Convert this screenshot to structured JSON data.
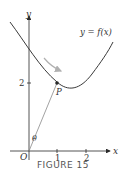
{
  "figure": {
    "caption": "FIGURE 15",
    "curve_label": "y = f(x)",
    "point_label": "P",
    "angle_label": "θ",
    "origin_label": "O",
    "x_axis_label": "x",
    "y_axis_label": "y",
    "x_ticks": [
      "1",
      "2"
    ],
    "y_ticks": [
      "2"
    ]
  },
  "colors": {
    "curve": "#3a3a3a",
    "segment": "#8a8a8a",
    "arrow": "#b0b0b0",
    "axes": "#2a2a2a"
  }
}
